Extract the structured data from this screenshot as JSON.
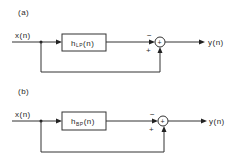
{
  "diagrams": [
    {
      "panel_label": "(a)",
      "input_label": "x(n)",
      "filter": {
        "base": "h",
        "subscript": "LP",
        "arg": "(n)"
      },
      "sum_symbol": "+",
      "top_sign": "−",
      "bottom_sign": "+",
      "output_label": "y(n)"
    },
    {
      "panel_label": "(b)",
      "input_label": "x(n)",
      "filter": {
        "base": "h",
        "subscript": "BP",
        "arg": "(n)"
      },
      "sum_symbol": "+",
      "top_sign": "−",
      "bottom_sign": "+",
      "output_label": "y(n)"
    }
  ]
}
